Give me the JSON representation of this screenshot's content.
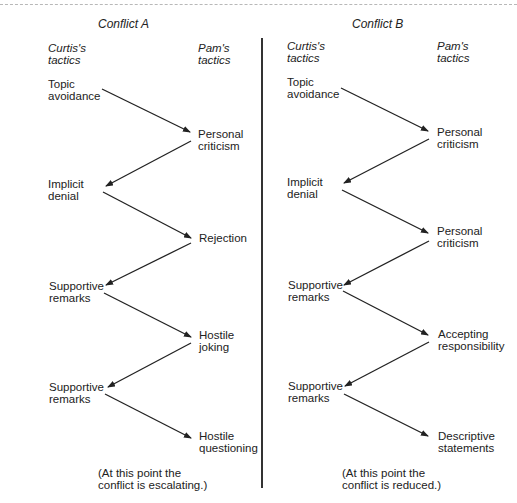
{
  "figure": {
    "panels": [
      {
        "title": "Conflict A",
        "left_header": [
          "Curtis's",
          "tactics"
        ],
        "right_header": [
          "Pam's",
          "tactics"
        ],
        "curtis_tactics": [
          [
            "Topic",
            "avoidance"
          ],
          [
            "Implicit",
            "denial"
          ],
          [
            "Supportive",
            "remarks"
          ],
          [
            "Supportive",
            "remarks"
          ]
        ],
        "pam_tactics": [
          [
            "Personal",
            "criticism"
          ],
          [
            "Rejection"
          ],
          [
            "Hostile",
            "joking"
          ],
          [
            "Hostile",
            "questioning"
          ]
        ],
        "note": [
          "(At this point the",
          "conflict is escalating.)"
        ]
      },
      {
        "title": "Conflict B",
        "left_header": [
          "Curtis's",
          "tactics"
        ],
        "right_header": [
          "Pam's",
          "tactics"
        ],
        "curtis_tactics": [
          [
            "Topic",
            "avoidance"
          ],
          [
            "Implicit",
            "denial"
          ],
          [
            "Supportive",
            "remarks"
          ],
          [
            "Supportive",
            "remarks"
          ]
        ],
        "pam_tactics": [
          [
            "Personal",
            "criticism"
          ],
          [
            "Personal",
            "criticism"
          ],
          [
            "Accepting",
            "responsibility"
          ],
          [
            "Descriptive",
            "statements"
          ]
        ],
        "note": [
          "(At this point the",
          "conflict is reduced.)"
        ]
      }
    ],
    "colors": {
      "line": "#222222",
      "text": "#222222",
      "divider": "#333333",
      "top_rule": "#b8b8b8"
    }
  }
}
